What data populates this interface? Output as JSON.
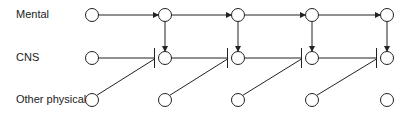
{
  "diagram": {
    "rows": [
      {
        "label": "Mental",
        "y": 15
      },
      {
        "label": "CNS",
        "y": 58
      },
      {
        "label": "Other physical",
        "y": 100
      }
    ],
    "columns_x": [
      92,
      165,
      238,
      312,
      387
    ],
    "node_radius": 6.5,
    "edges": {
      "mental_horizontal_arrows": "Mental(t) -> Mental(t+1)",
      "mental_to_cns_down_arrows": "Mental(t+1) -> CNS(t+1), columns 2-5",
      "cns_horizontal_blocked": "CNS(t) -| CNS(t+1)",
      "physical_to_cns_diagonal_blocked": "Other physical(t) -| CNS(t+1)"
    },
    "colors": {
      "stroke": "#222222",
      "text": "#222222",
      "background": "#ffffff"
    }
  }
}
